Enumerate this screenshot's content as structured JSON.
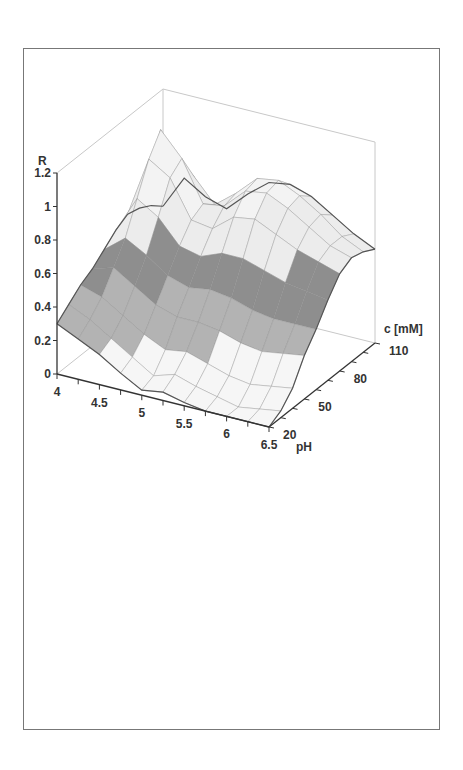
{
  "chart_data": {
    "type": "surface3d",
    "title": "",
    "zlabel": "R",
    "xlabel": "pH",
    "ylabel": "c [mM]",
    "x_ticks": [
      "4",
      "4.5",
      "5",
      "5.5",
      "6",
      "6.5"
    ],
    "y_ticks": [
      "20",
      "50",
      "80",
      "110"
    ],
    "z_ticks": [
      "0",
      "0.2",
      "0.4",
      "0.6",
      "0.8",
      "1",
      "1.2"
    ],
    "xlim": [
      4,
      6.5
    ],
    "ylim": [
      20,
      110
    ],
    "zlim": [
      0,
      1.2
    ],
    "grid": true,
    "colormap": "grayscale banded by R (0.2 steps)",
    "x": [
      4.0,
      4.25,
      4.5,
      4.75,
      5.0,
      5.25,
      5.5,
      5.75,
      6.0,
      6.25,
      6.5
    ],
    "y": [
      20,
      30,
      40,
      50,
      60,
      70,
      80,
      90,
      100,
      110
    ],
    "z_rows_by_c": [
      [
        0.3,
        0.24,
        0.18,
        0.1,
        0.03,
        0.05,
        0.02,
        0.0,
        0.0,
        0.0,
        0.0
      ],
      [
        0.36,
        0.3,
        0.22,
        0.14,
        0.06,
        0.1,
        0.06,
        0.03,
        0.0,
        0.02,
        0.04
      ],
      [
        0.42,
        0.38,
        0.3,
        0.22,
        0.16,
        0.18,
        0.14,
        0.1,
        0.08,
        0.1,
        0.12
      ],
      [
        0.46,
        0.5,
        0.42,
        0.34,
        0.3,
        0.3,
        0.28,
        0.24,
        0.22,
        0.24,
        0.26
      ],
      [
        0.52,
        0.62,
        0.55,
        0.46,
        0.42,
        0.44,
        0.42,
        0.38,
        0.36,
        0.36,
        0.36
      ],
      [
        0.58,
        0.8,
        0.72,
        0.58,
        0.55,
        0.6,
        0.6,
        0.56,
        0.52,
        0.5,
        0.48
      ],
      [
        0.62,
        0.98,
        0.9,
        0.68,
        0.66,
        0.76,
        0.78,
        0.72,
        0.66,
        0.62,
        0.58
      ],
      [
        0.6,
        1.1,
        0.96,
        0.72,
        0.74,
        0.86,
        0.88,
        0.82,
        0.74,
        0.66,
        0.62
      ],
      [
        0.56,
        0.92,
        0.8,
        0.66,
        0.76,
        0.88,
        0.9,
        0.84,
        0.76,
        0.66,
        0.6
      ],
      [
        0.5,
        0.7,
        0.62,
        0.58,
        0.7,
        0.8,
        0.82,
        0.78,
        0.7,
        0.62,
        0.56
      ]
    ]
  },
  "labels": {
    "z_axis": "R",
    "x_axis": "pH",
    "y_axis": "c [mM]"
  },
  "colors": {
    "frame": "#777777",
    "axis": "#333333",
    "box": "#c8c8c8",
    "mesh": "#8a8a8a",
    "bands": [
      "#f4f4f4",
      "#bdbdbd",
      "#8c8c8c",
      "#f0f0f0",
      "#d6d6d6",
      "#e8e8e8"
    ]
  }
}
